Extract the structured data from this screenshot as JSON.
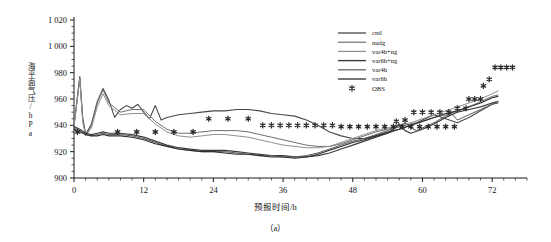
{
  "chart_data": {
    "type": "line",
    "title": "",
    "caption": "（a）",
    "xlabel": "预报时间/h",
    "ylabel": "海平面气压/hPa",
    "xlim": [
      0,
      78
    ],
    "ylim": [
      900,
      1020
    ],
    "xticks": [
      0,
      12,
      24,
      36,
      48,
      60,
      72
    ],
    "xtick_labels": [
      "0",
      "12",
      "24",
      "36",
      "48",
      "60",
      "72"
    ],
    "xminor_step": 2,
    "yticks": [
      900,
      920,
      940,
      960,
      980,
      1000,
      1020
    ],
    "ytick_labels": [
      "900",
      "920",
      "940",
      "960",
      "980",
      "1 000",
      "1 020"
    ],
    "yminor_step": 5,
    "grid": false,
    "legend_position": "top-right",
    "series": [
      {
        "name": "cntl",
        "style": "line",
        "color": "#4a4a4a",
        "width": 1.1,
        "x": [
          0,
          1,
          1.5,
          2,
          3,
          4,
          5,
          6,
          7,
          8,
          9,
          10,
          11,
          12,
          13,
          14,
          15,
          16,
          18,
          20,
          22,
          24,
          26,
          28,
          30,
          32,
          34,
          36,
          38,
          40,
          42,
          44,
          46,
          48,
          50,
          52,
          54,
          56,
          58,
          60,
          62,
          64,
          66,
          68,
          70,
          72,
          73
        ],
        "y": [
          940,
          977,
          946,
          933,
          941,
          958,
          968,
          959,
          946,
          952,
          955,
          953,
          956,
          950,
          945,
          955,
          944,
          946,
          948,
          949,
          950,
          951,
          951,
          952,
          952,
          951,
          949,
          948,
          947,
          944,
          940,
          935,
          932,
          930,
          930,
          932,
          934,
          937,
          940,
          944,
          948,
          945,
          942,
          946,
          951,
          956,
          957
        ]
      },
      {
        "name": "nudg",
        "style": "line",
        "color": "#6e6e6e",
        "width": 1.0,
        "x": [
          0,
          1,
          1.5,
          2,
          3,
          4,
          5,
          6,
          8,
          10,
          12,
          14,
          16,
          18,
          20,
          22,
          24,
          26,
          28,
          30,
          32,
          34,
          36,
          38,
          40,
          42,
          44,
          46,
          48,
          50,
          52,
          54,
          56,
          58,
          60,
          62,
          64,
          66,
          68,
          70,
          72,
          73
        ],
        "y": [
          940,
          976,
          944,
          932,
          940,
          957,
          967,
          957,
          950,
          952,
          952,
          943,
          937,
          934,
          934,
          935,
          936,
          936,
          936,
          935,
          933,
          931,
          929,
          927,
          925,
          924,
          924,
          926,
          929,
          932,
          935,
          937,
          939,
          941,
          943,
          946,
          948,
          951,
          954,
          958,
          962,
          963
        ]
      },
      {
        "name": "var4h+ng",
        "style": "line",
        "color": "#8f8f8f",
        "width": 1.0,
        "x": [
          0,
          1,
          1.5,
          2,
          3,
          4,
          5,
          6,
          8,
          10,
          12,
          14,
          16,
          18,
          20,
          22,
          24,
          26,
          28,
          30,
          32,
          34,
          36,
          38,
          40,
          42,
          44,
          46,
          48,
          50,
          52,
          54,
          56,
          58,
          60,
          62,
          64,
          66,
          68,
          70,
          72,
          73
        ],
        "y": [
          939,
          975,
          943,
          932,
          938,
          954,
          964,
          955,
          948,
          949,
          949,
          941,
          935,
          932,
          931,
          932,
          933,
          933,
          932,
          931,
          929,
          927,
          925,
          924,
          923,
          923,
          924,
          927,
          930,
          933,
          936,
          938,
          940,
          942,
          945,
          948,
          951,
          954,
          957,
          960,
          964,
          966
        ]
      },
      {
        "name": "var6h+ng",
        "style": "line",
        "color": "#3c3c3c",
        "width": 1.2,
        "x": [
          0,
          1,
          2,
          3,
          4,
          5,
          6,
          8,
          10,
          12,
          14,
          16,
          18,
          20,
          22,
          24,
          26,
          28,
          30,
          32,
          34,
          36,
          38,
          40,
          42,
          44,
          46,
          48,
          50,
          52,
          54,
          55,
          56,
          57,
          58,
          60,
          62,
          64,
          66,
          68,
          70,
          72,
          73
        ],
        "y": [
          939,
          937,
          934,
          933,
          934,
          935,
          934,
          934,
          933,
          931,
          928,
          925,
          923,
          922,
          921,
          921,
          921,
          920,
          919,
          918,
          917,
          917,
          916,
          916,
          917,
          919,
          922,
          925,
          928,
          931,
          934,
          937,
          941,
          936,
          934,
          937,
          941,
          946,
          950,
          952,
          954,
          957,
          958
        ]
      },
      {
        "name": "var4h",
        "style": "line",
        "color": "#5a5a5a",
        "width": 1.0,
        "x": [
          0,
          1,
          2,
          3,
          4,
          5,
          6,
          8,
          10,
          12,
          14,
          16,
          18,
          20,
          22,
          24,
          26,
          28,
          30,
          32,
          34,
          36,
          38,
          40,
          42,
          44,
          46,
          48,
          50,
          52,
          54,
          56,
          57,
          58,
          59,
          60,
          62,
          64,
          65,
          66,
          68,
          70,
          72,
          73
        ],
        "y": [
          938,
          936,
          933,
          932,
          933,
          934,
          933,
          933,
          932,
          930,
          927,
          924,
          922,
          921,
          920,
          920,
          920,
          919,
          918,
          917,
          917,
          916,
          916,
          917,
          919,
          922,
          925,
          928,
          930,
          933,
          936,
          939,
          942,
          938,
          936,
          938,
          942,
          947,
          949,
          944,
          948,
          952,
          956,
          958
        ]
      },
      {
        "name": "var6h",
        "style": "line",
        "color": "#2e2e2e",
        "width": 1.1,
        "x": [
          0,
          1,
          2,
          3,
          4,
          5,
          6,
          8,
          10,
          12,
          14,
          16,
          18,
          20,
          22,
          24,
          26,
          28,
          30,
          32,
          34,
          36,
          38,
          40,
          42,
          44,
          46,
          48,
          50,
          52,
          54,
          56,
          58,
          60,
          62,
          64,
          66,
          68,
          70,
          72,
          73
        ],
        "y": [
          937,
          935,
          933,
          932,
          932,
          933,
          932,
          932,
          931,
          929,
          926,
          924,
          922,
          921,
          920,
          920,
          919,
          918,
          918,
          917,
          916,
          916,
          915,
          916,
          918,
          921,
          924,
          927,
          929,
          932,
          935,
          937,
          940,
          943,
          946,
          949,
          951,
          954,
          957,
          961,
          962
        ]
      }
    ],
    "obs": {
      "name": "OBS",
      "style": "marker",
      "marker": "*",
      "color": "#2b2b2b",
      "points": [
        [
          0.6,
          935
        ],
        [
          7.5,
          935
        ],
        [
          10.8,
          935
        ],
        [
          14.0,
          935
        ],
        [
          17.2,
          935
        ],
        [
          20.5,
          935
        ],
        [
          23.2,
          945
        ],
        [
          26.5,
          945
        ],
        [
          30.0,
          945
        ],
        [
          32.5,
          940
        ],
        [
          34.0,
          940
        ],
        [
          35.5,
          940
        ],
        [
          37.0,
          940
        ],
        [
          38.5,
          940
        ],
        [
          40.0,
          940
        ],
        [
          41.5,
          940
        ],
        [
          43.0,
          940
        ],
        [
          44.5,
          940
        ],
        [
          46.0,
          939
        ],
        [
          47.5,
          939
        ],
        [
          49.0,
          939
        ],
        [
          50.5,
          939
        ],
        [
          52.0,
          939
        ],
        [
          53.5,
          939
        ],
        [
          55.0,
          939
        ],
        [
          56.5,
          939
        ],
        [
          58.0,
          939
        ],
        [
          59.5,
          939
        ],
        [
          61.0,
          939
        ],
        [
          62.5,
          939
        ],
        [
          64.0,
          939
        ],
        [
          65.5,
          939
        ],
        [
          55.5,
          943
        ],
        [
          57.0,
          944
        ],
        [
          58.5,
          950
        ],
        [
          60.0,
          950
        ],
        [
          61.5,
          950
        ],
        [
          63.0,
          950
        ],
        [
          64.5,
          950
        ],
        [
          66.0,
          953
        ],
        [
          67.5,
          953
        ],
        [
          68.0,
          960
        ],
        [
          69.0,
          960
        ],
        [
          70.0,
          960
        ],
        [
          70.5,
          970
        ],
        [
          71.5,
          975
        ],
        [
          72.5,
          984
        ],
        [
          73.5,
          984
        ],
        [
          74.5,
          984
        ],
        [
          75.5,
          984
        ]
      ]
    }
  },
  "legend": {
    "entries": [
      {
        "label": "cntl"
      },
      {
        "label": "nudg"
      },
      {
        "label": "var4h+ng"
      },
      {
        "label": "var6h+ng"
      },
      {
        "label": "var4h"
      },
      {
        "label": "var6h"
      },
      {
        "label": "OBS"
      }
    ]
  }
}
